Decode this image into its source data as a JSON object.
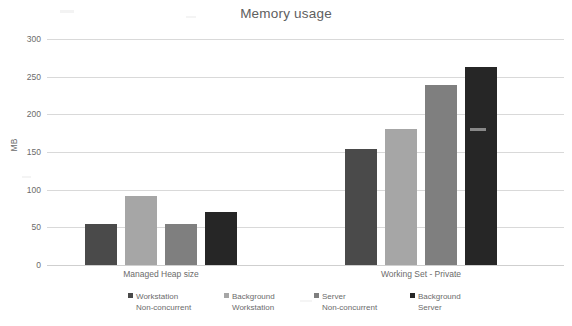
{
  "chart_data": {
    "type": "bar",
    "title": "Memory usage",
    "xlabel": "",
    "ylabel": "MB",
    "categories": [
      "Managed Heap size",
      "Working Set - Private"
    ],
    "ylim": [
      0,
      300
    ],
    "yticks": [
      300,
      250,
      200,
      150,
      100,
      50,
      0
    ],
    "grid": true,
    "legend_position": "bottom",
    "series": [
      {
        "name": "Workstation Non-concurrent",
        "name_line1": "Workstation",
        "name_line2": "Non-concurrent",
        "color": "#4a4a4a",
        "values": [
          55,
          154
        ]
      },
      {
        "name": "Background Workstation",
        "name_line1": "Background",
        "name_line2": "Workstation",
        "color": "#a6a6a6",
        "values": [
          92,
          180
        ]
      },
      {
        "name": "Server Non-concurrent",
        "name_line1": "Server",
        "name_line2": "Non-concurrent",
        "color": "#7f7f7f",
        "values": [
          54,
          239
        ]
      },
      {
        "name": "Background Server",
        "name_line1": "Background",
        "name_line2": "Server",
        "color": "#262626",
        "values": [
          71,
          263
        ]
      }
    ]
  },
  "axis": {
    "y_title": "MB",
    "tick_labels": [
      "300",
      "250",
      "200",
      "150",
      "100",
      "50",
      "0"
    ]
  },
  "colors": {
    "text": "#6b6b6b",
    "title": "#606060",
    "gridline": "#d9d9d9",
    "background": "#ffffff"
  }
}
